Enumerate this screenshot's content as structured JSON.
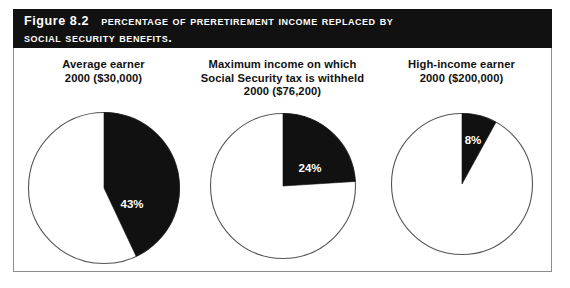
{
  "figure": {
    "caption_label": "Figure 8.2",
    "caption_line1": "Percentage of preretirement income replaced by",
    "caption_line2": "Social Security benefits.",
    "banner_color": "#111111",
    "banner_text_color": "#ffffff",
    "frame_color": "#8d8d8d"
  },
  "chart_data": {
    "type": "pie",
    "title": "Percentage of preretirement income replaced by Social Security benefits.",
    "xlabel": "",
    "ylabel": "",
    "legend_position": "none",
    "grid": false,
    "slice_color": "#111111",
    "remainder_color": "#ffffff",
    "outline_color": "#555555",
    "charts": [
      {
        "id": "average-earner",
        "title_lines": [
          "Average earner",
          "2000 ($30,000)"
        ],
        "categories": [
          "Replaced by Social Security",
          "Not replaced"
        ],
        "values": [
          43,
          57
        ],
        "data_label": "43%",
        "start_angle_deg": 0,
        "sweep_deg": 154.8
      },
      {
        "id": "maximum-income",
        "title_lines": [
          "Maximum income on which",
          "Social Security tax is withheld",
          "2000 ($76,200)"
        ],
        "categories": [
          "Replaced by Social Security",
          "Not replaced"
        ],
        "values": [
          24,
          76
        ],
        "data_label": "24%",
        "start_angle_deg": 0,
        "sweep_deg": 86.4
      },
      {
        "id": "high-income-earner",
        "title_lines": [
          "High-income earner",
          "2000 ($200,000)"
        ],
        "categories": [
          "Replaced by Social Security",
          "Not replaced"
        ],
        "values": [
          8,
          92
        ],
        "data_label": "8%",
        "start_angle_deg": 0,
        "sweep_deg": 28.8
      }
    ]
  }
}
